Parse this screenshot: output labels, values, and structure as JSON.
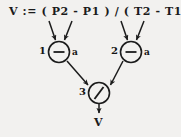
{
  "diagram": {
    "statement": "V := ( P2 - P1 ) / ( T2 - T1 );",
    "background_color": "#f2f1ef",
    "ink_color": "#1b1b1b",
    "nodes": [
      {
        "id": "node-1",
        "number": "1",
        "operator": "minus",
        "operator_glyph": "–",
        "tag": "a",
        "cx": 59,
        "cy": 52,
        "r": 11,
        "inputs": [
          "P2",
          "P1"
        ]
      },
      {
        "id": "node-2",
        "number": "2",
        "operator": "minus",
        "operator_glyph": "–",
        "tag": "a",
        "cx": 131,
        "cy": 52,
        "r": 11,
        "inputs": [
          "T2",
          "T1"
        ]
      },
      {
        "id": "node-3",
        "number": "3",
        "operator": "divide",
        "operator_glyph": "/",
        "tag": "",
        "cx": 99,
        "cy": 93,
        "r": 11,
        "inputs": [
          "node-1",
          "node-2"
        ]
      }
    ],
    "output": {
      "label": "V",
      "from": "node-3"
    },
    "edges": [
      {
        "name": "edge-p2-to-node1",
        "from": "P2",
        "to": "node-1",
        "x1": 49,
        "y1": 21,
        "x2": 55,
        "y2": 41
      },
      {
        "name": "edge-p1-to-node1",
        "from": "P1",
        "to": "node-1",
        "x1": 72,
        "y1": 21,
        "x2": 64,
        "y2": 41
      },
      {
        "name": "edge-t2-to-node2",
        "from": "T2",
        "to": "node-2",
        "x1": 121,
        "y1": 21,
        "x2": 127,
        "y2": 41
      },
      {
        "name": "edge-t1-to-node2",
        "from": "T1",
        "to": "node-2",
        "x1": 144,
        "y1": 21,
        "x2": 136,
        "y2": 41
      },
      {
        "name": "edge-node1-to-node3",
        "from": "node-1",
        "to": "node-3",
        "x1": 67,
        "y1": 61,
        "x2": 89,
        "y2": 86
      },
      {
        "name": "edge-node2-to-node3",
        "from": "node-2",
        "to": "node-3",
        "x1": 123,
        "y1": 61,
        "x2": 110,
        "y2": 86
      },
      {
        "name": "edge-node3-to-output",
        "from": "node-3",
        "to": "output",
        "x1": 99,
        "y1": 104,
        "x2": 99,
        "y2": 114
      }
    ]
  }
}
